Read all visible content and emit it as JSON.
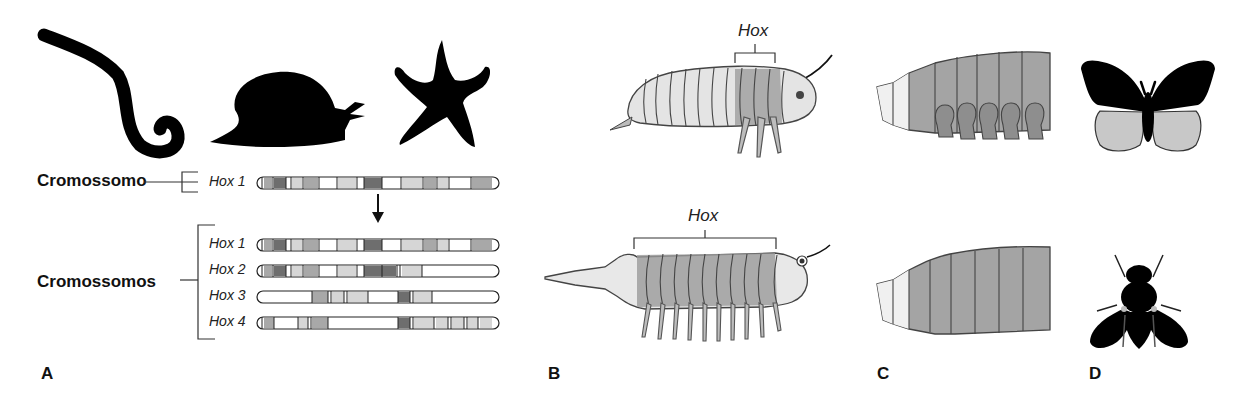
{
  "figure": {
    "panels": [
      {
        "id": "A",
        "label": "A"
      },
      {
        "id": "B",
        "label": "B"
      },
      {
        "id": "C",
        "label": "C"
      },
      {
        "id": "D",
        "label": "D"
      }
    ],
    "panel_a": {
      "organisms": [
        "worm-silhouette",
        "snail-silhouette",
        "starfish-silhouette"
      ],
      "single_label": "Cromossomo",
      "multiple_label": "Cromossomos",
      "arrow": "down-arrow",
      "ancestral_chromosome": {
        "label": "Hox 1"
      },
      "chromosomes": [
        {
          "label": "Hox 1"
        },
        {
          "label": "Hox 2"
        },
        {
          "label": "Hox 3"
        },
        {
          "label": "Hox 4"
        }
      ]
    },
    "panel_b": {
      "top_bracket_label": "Hox",
      "bottom_bracket_label": "Hox",
      "top_organism": "arthropod-few-legs",
      "bottom_organism": "arthropod-many-legs"
    },
    "panel_c": {
      "top": "abdomen-with-prolegs",
      "bottom": "abdomen-without-legs"
    },
    "panel_d": {
      "top": "butterfly-silhouette",
      "bottom": "fly-silhouette"
    },
    "colors": {
      "dark_band": "#6e6e6e",
      "mid_band": "#a8a8a8",
      "light_band": "#d6d6d6",
      "blank_band": "#ffffff",
      "outline": "#222222",
      "segment_gray": "#9a9a9a",
      "segment_light": "#e2e2e2",
      "wing_gray": "#c8c8c8"
    }
  }
}
